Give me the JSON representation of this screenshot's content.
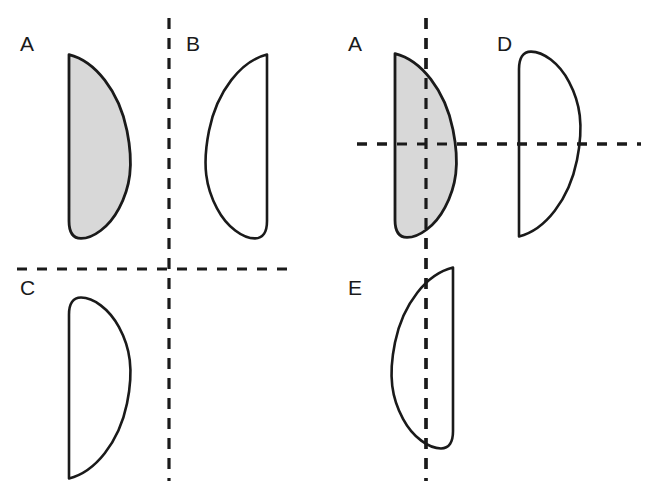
{
  "figure": {
    "background_color": "#ffffff",
    "width": 649,
    "height": 490,
    "outline_color": "#1a1a1a",
    "fill_color": "#d8d8d8",
    "dash_color": "#1a1a1a"
  },
  "panels": [
    {
      "id": "left-panel",
      "name": "left-panel",
      "reference_shape": "A",
      "axis_orientation": "vertical-and-horizontal",
      "shapes": [
        "A",
        "B",
        "C"
      ]
    },
    {
      "id": "right-panel",
      "name": "right-panel",
      "reference_shape": "A",
      "axis_orientation": "vertical-and-horizontal",
      "shapes": [
        "A",
        "D",
        "E"
      ]
    }
  ],
  "shapes": {
    "left_A": {
      "label": "A",
      "filled": true,
      "fill": "#d8d8d8",
      "description": "reference leaf shape, straight edge on left, pointed top-left, rounded bottom",
      "bbox": [
        67,
        53,
        129,
        240
      ]
    },
    "left_B": {
      "label": "B",
      "filled": false,
      "fill": "none",
      "description": "mirror of A across vertical axis, straight edge on right",
      "bbox": [
        207,
        53,
        269,
        240
      ]
    },
    "left_C": {
      "label": "C",
      "filled": false,
      "fill": "none",
      "description": "mirror of A across horizontal axis, rounded top, pointed bottom-left",
      "bbox": [
        67,
        296,
        129,
        480
      ]
    },
    "right_A": {
      "label": "A",
      "filled": true,
      "fill": "#d8d8d8",
      "description": "reference leaf shape, straight edge on left, pointed top-left, rounded bottom",
      "bbox": [
        393,
        52,
        455,
        239
      ]
    },
    "right_D": {
      "label": "D",
      "filled": false,
      "fill": "none",
      "description": "mirror of A across horizontal axis, rounded top, pointed bottom-left",
      "bbox": [
        517,
        50,
        579,
        238
      ]
    },
    "right_E": {
      "label": "E",
      "filled": false,
      "fill": "none",
      "description": "mirror of A across vertical axis, straight edge on right",
      "bbox": [
        393,
        266,
        455,
        450
      ]
    }
  },
  "labels": [
    {
      "name": "label-left-A",
      "text": "A",
      "x": 20,
      "y": 51
    },
    {
      "name": "label-left-B",
      "text": "B",
      "x": 186,
      "y": 51
    },
    {
      "name": "label-left-C",
      "text": "C",
      "x": 20,
      "y": 295
    },
    {
      "name": "label-right-A",
      "text": "A",
      "x": 348,
      "y": 51
    },
    {
      "name": "label-right-D",
      "text": "D",
      "x": 497,
      "y": 51
    },
    {
      "name": "label-right-E",
      "text": "E",
      "x": 348,
      "y": 295
    }
  ],
  "axes": {
    "left_vertical": {
      "name": "left-vertical-dashed-axis",
      "x": 169,
      "y1": 18,
      "y2": 481
    },
    "left_horizontal": {
      "name": "left-horizontal-dashed-axis",
      "y": 269,
      "x1": 17,
      "x2": 291
    },
    "right_vertical": {
      "name": "right-vertical-dashed-axis",
      "x": 426,
      "y1": 18,
      "y2": 481
    },
    "right_horizontal": {
      "name": "right-horizontal-dashed-axis",
      "y": 144,
      "x1": 357,
      "x2": 641
    }
  },
  "geometry": {
    "shape_path_A": "M 2 2 C 28 10 52 48 60 98 C 67 142 63 170 52 196 C 42 220 26 234 14 234 C 6 234 2 226 2 212 Z",
    "dash_pattern_long": "11 9",
    "dash_pattern_short": "10 10"
  }
}
